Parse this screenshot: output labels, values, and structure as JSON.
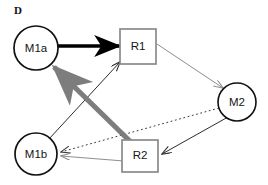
{
  "figure": {
    "panel_label": "D",
    "width": 268,
    "height": 185,
    "background": "#ffffff"
  },
  "colors": {
    "node_stroke": "#111111",
    "box_stroke": "#8a8a8a",
    "node_fill": "#ffffff",
    "thick_black_edge": "#000000",
    "thick_gray_edge": "#7d7d7d",
    "thin_gray_edge": "#8e8e8e",
    "thin_black_edge": "#2b2b2b",
    "dotted_edge": "#3a3a3a",
    "label_text": "#151515"
  },
  "nodes": [
    {
      "id": "M1a",
      "label": "M1a",
      "shape": "circle",
      "cx": 36,
      "cy": 48,
      "r": 22
    },
    {
      "id": "R1",
      "label": "R1",
      "shape": "rect",
      "x": 120,
      "y": 29,
      "w": 36,
      "h": 35
    },
    {
      "id": "M2",
      "label": "M2",
      "shape": "circle",
      "cx": 237,
      "cy": 102,
      "r": 19
    },
    {
      "id": "M1b",
      "label": "M1b",
      "shape": "circle",
      "cx": 36,
      "cy": 154,
      "r": 21
    },
    {
      "id": "R2",
      "label": "R2",
      "shape": "rect",
      "x": 122,
      "y": 140,
      "w": 36,
      "h": 32
    }
  ],
  "edges": [
    {
      "id": "m1a-to-r1",
      "from": "M1a",
      "to": "R1",
      "style": "solid",
      "weight": "thick",
      "color": "thick_black_edge",
      "arrow": "end"
    },
    {
      "id": "r2-to-m1a",
      "from": "R2",
      "to": "M1a",
      "style": "solid",
      "weight": "thick",
      "color": "thick_gray_edge",
      "arrow": "end"
    },
    {
      "id": "m1b-to-r1",
      "from": "M1b",
      "to": "R1",
      "style": "solid",
      "weight": "thin",
      "color": "thin_black_edge",
      "arrow": "end"
    },
    {
      "id": "r1-to-m2",
      "from": "R1",
      "to": "M2",
      "style": "solid",
      "weight": "thin",
      "color": "thin_gray_edge",
      "arrow": "end"
    },
    {
      "id": "m2-to-r2",
      "from": "M2",
      "to": "R2",
      "style": "solid",
      "weight": "thin",
      "color": "thin_black_edge",
      "arrow": "end"
    },
    {
      "id": "m2-to-m1b",
      "from": "M2",
      "to": "M1b",
      "style": "dotted",
      "weight": "thin",
      "color": "dotted_edge",
      "arrow": "end"
    },
    {
      "id": "r2-to-m1b",
      "from": "R2",
      "to": "M1b",
      "style": "solid",
      "weight": "thin",
      "color": "thin_gray_edge",
      "arrow": "end"
    }
  ]
}
